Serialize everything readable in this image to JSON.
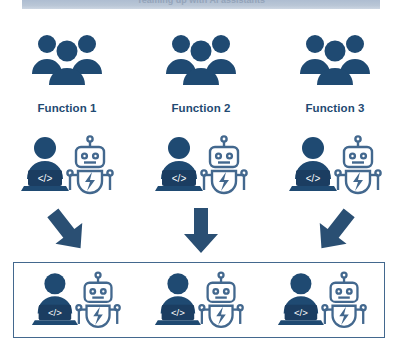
{
  "banner": {
    "text": "Teaming up with AI assistants"
  },
  "colors": {
    "navy_solid": "#1f4a72",
    "robot_outline": "#43688e",
    "arrow": "#2a4f73",
    "box_border": "#43688e",
    "banner_bg": "#b9c6d6"
  },
  "columns": [
    {
      "label": "Function 1",
      "group_icon": "people-group-icon"
    },
    {
      "label": "Function 2",
      "group_icon": "people-group-icon"
    },
    {
      "label": "Function 3",
      "group_icon": "people-group-icon"
    }
  ],
  "pairs": [
    {
      "human_icon": "developer-laptop-icon",
      "robot_icon": "ai-robot-icon",
      "code_glyph": "</>"
    },
    {
      "human_icon": "developer-laptop-icon",
      "robot_icon": "ai-robot-icon",
      "code_glyph": "</>"
    },
    {
      "human_icon": "developer-laptop-icon",
      "robot_icon": "ai-robot-icon",
      "code_glyph": "</>"
    }
  ],
  "arrows": [
    {
      "name": "arrow-down-right-icon",
      "direction": "down-right"
    },
    {
      "name": "arrow-down-icon",
      "direction": "down"
    },
    {
      "name": "arrow-down-left-icon",
      "direction": "down-left"
    }
  ],
  "merged_team": {
    "members": [
      {
        "human_icon": "developer-laptop-icon",
        "robot_icon": "ai-robot-icon",
        "code_glyph": "</>"
      },
      {
        "human_icon": "developer-laptop-icon",
        "robot_icon": "ai-robot-icon",
        "code_glyph": "</>"
      },
      {
        "human_icon": "developer-laptop-icon",
        "robot_icon": "ai-robot-icon",
        "code_glyph": "</>"
      }
    ]
  }
}
